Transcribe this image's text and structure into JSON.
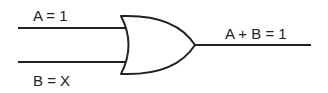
{
  "diagram": {
    "type": "logic-gate",
    "gate": "OR",
    "inputs": [
      {
        "name": "A",
        "label": "A = 1"
      },
      {
        "name": "B",
        "label": "B = X"
      }
    ],
    "output": {
      "label": "A + B = 1"
    },
    "colors": {
      "stroke": "#222222",
      "background": "#ffffff"
    }
  }
}
